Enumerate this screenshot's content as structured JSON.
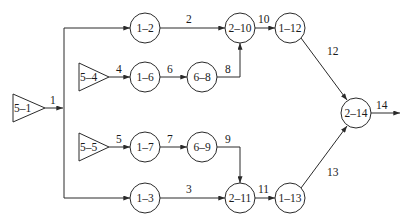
{
  "diagram": {
    "type": "network-flow",
    "colors": {
      "stroke": "#2a2a2a",
      "text": "#1a1a1a",
      "background": "#ffffff"
    },
    "nodes": [
      {
        "id": "5-1",
        "shape": "triangle",
        "label": "5–1"
      },
      {
        "id": "5-4",
        "shape": "triangle",
        "label": "5–4"
      },
      {
        "id": "5-5",
        "shape": "triangle",
        "label": "5–5"
      },
      {
        "id": "1-2",
        "shape": "circle",
        "label": "1–2"
      },
      {
        "id": "1-3",
        "shape": "circle",
        "label": "1–3"
      },
      {
        "id": "1-6",
        "shape": "circle",
        "label": "1–6"
      },
      {
        "id": "1-7",
        "shape": "circle",
        "label": "1–7"
      },
      {
        "id": "6-8",
        "shape": "circle",
        "label": "6–8"
      },
      {
        "id": "6-9",
        "shape": "circle",
        "label": "6–9"
      },
      {
        "id": "2-10",
        "shape": "circle",
        "label": "2–10"
      },
      {
        "id": "2-11",
        "shape": "circle",
        "label": "2–11"
      },
      {
        "id": "1-12",
        "shape": "circle",
        "label": "1–12"
      },
      {
        "id": "1-13",
        "shape": "circle",
        "label": "1–13"
      },
      {
        "id": "2-14",
        "shape": "circle",
        "label": "2–14"
      }
    ],
    "edges": [
      {
        "label": "1",
        "from": "5-1",
        "to": [
          "1-2",
          "1-3"
        ]
      },
      {
        "label": "2",
        "from": "1-2",
        "to": "2-10"
      },
      {
        "label": "3",
        "from": "1-3",
        "to": "2-11"
      },
      {
        "label": "4",
        "from": "5-4",
        "to": "1-6"
      },
      {
        "label": "5",
        "from": "5-5",
        "to": "1-7"
      },
      {
        "label": "6",
        "from": "1-6",
        "to": "6-8"
      },
      {
        "label": "7",
        "from": "1-7",
        "to": "6-9"
      },
      {
        "label": "8",
        "from": "6-8",
        "to": "2-10"
      },
      {
        "label": "9",
        "from": "6-9",
        "to": "2-11"
      },
      {
        "label": "10",
        "from": "2-10",
        "to": "1-12"
      },
      {
        "label": "11",
        "from": "2-11",
        "to": "1-13"
      },
      {
        "label": "12",
        "from": "1-12",
        "to": "2-14"
      },
      {
        "label": "13",
        "from": "1-13",
        "to": "2-14"
      },
      {
        "label": "14",
        "from": "2-14",
        "to": "output"
      }
    ]
  }
}
